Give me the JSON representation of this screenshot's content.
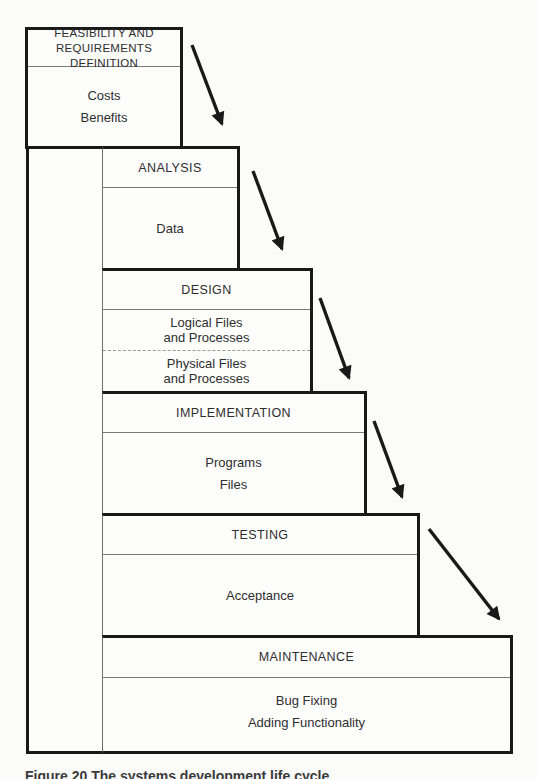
{
  "diagram": {
    "stages": [
      {
        "name": "feasibility",
        "title_lines": [
          "FEASIBILITY AND",
          "REQUIREMENTS DEFINITION"
        ],
        "items": [
          "Costs",
          "Benefits"
        ]
      },
      {
        "name": "analysis",
        "title": "ANALYSIS",
        "items": [
          "Data"
        ]
      },
      {
        "name": "design",
        "title": "DESIGN",
        "sub_rows": [
          {
            "lines": [
              "Logical Files",
              "and Processes"
            ]
          },
          {
            "lines": [
              "Physical Files",
              "and Processes"
            ]
          }
        ]
      },
      {
        "name": "implementation",
        "title": "IMPLEMENTATION",
        "items": [
          "Programs",
          "Files"
        ]
      },
      {
        "name": "testing",
        "title": "TESTING",
        "items": [
          "Acceptance"
        ]
      },
      {
        "name": "maintenance",
        "title": "MAINTENANCE",
        "items": [
          "Bug Fixing",
          "Adding Functionality"
        ]
      }
    ],
    "caption": "Figure 20 The systems development life cycle",
    "colors": {
      "line": "#191919",
      "thin_line": "#6e6e6e",
      "dashed_line": "#9a9a9a",
      "background": "#fbfbfa",
      "text": "#2e2e2e"
    }
  }
}
